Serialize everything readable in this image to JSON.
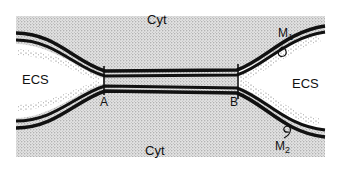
{
  "diagram": {
    "type": "membrane-junction-schematic",
    "labels": {
      "cyt_top": "Cyt",
      "cyt_bottom": "Cyt",
      "ecs_left": "ECS",
      "ecs_right": "ECS",
      "point_a": "A",
      "point_b": "B",
      "membrane_1": "M",
      "membrane_1_sub": "1",
      "membrane_2": "M",
      "membrane_2_sub": "2"
    },
    "colors": {
      "background": "#ffffff",
      "stipple_region": "#d9d9d9",
      "membrane": "#111111",
      "ecs": "#ffffff"
    }
  }
}
